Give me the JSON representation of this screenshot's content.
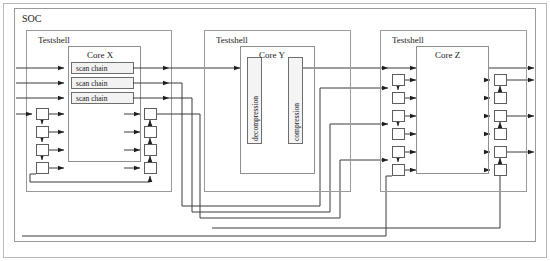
{
  "diagram": {
    "title": "SOC",
    "type": "block-diagram",
    "frame": {
      "x": 6,
      "y": 6,
      "w": 538,
      "h": 249
    },
    "soc": {
      "label": "SOC",
      "label_x": 22,
      "label_y": 12,
      "box": {
        "x": 14,
        "y": 8,
        "w": 522,
        "h": 234
      }
    },
    "testshells": [
      {
        "id": "testshell-x",
        "label": "Testshell",
        "label_x": 38,
        "label_y": 34,
        "box": {
          "x": 26,
          "y": 30,
          "w": 145,
          "h": 162
        },
        "core": {
          "id": "core-x",
          "label": "Core X",
          "label_x": 102,
          "label_y": 50,
          "box": {
            "x": 68,
            "y": 46,
            "w": 72,
            "h": 116
          },
          "scan_chains": [
            {
              "label": "scan chain",
              "x": 71,
              "y": 62,
              "w": 62,
              "h": 11
            },
            {
              "label": "scan chain",
              "x": 71,
              "y": 77,
              "w": 62,
              "h": 11
            },
            {
              "label": "scan chain",
              "x": 71,
              "y": 92,
              "w": 62,
              "h": 11
            }
          ]
        },
        "input_cells": [
          {
            "x": 36,
            "y": 108,
            "w": 12,
            "h": 12
          },
          {
            "x": 36,
            "y": 126,
            "w": 12,
            "h": 12
          },
          {
            "x": 36,
            "y": 144,
            "w": 12,
            "h": 12
          },
          {
            "x": 36,
            "y": 162,
            "w": 12,
            "h": 12
          }
        ],
        "output_cells": [
          {
            "x": 144,
            "y": 108,
            "w": 12,
            "h": 12
          },
          {
            "x": 144,
            "y": 126,
            "w": 12,
            "h": 12
          },
          {
            "x": 144,
            "y": 144,
            "w": 12,
            "h": 12
          },
          {
            "x": 144,
            "y": 162,
            "w": 12,
            "h": 12
          }
        ]
      },
      {
        "id": "testshell-y",
        "label": "Testshell",
        "label_x": 216,
        "label_y": 34,
        "box": {
          "x": 204,
          "y": 30,
          "w": 146,
          "h": 162
        },
        "core": {
          "id": "core-y",
          "label": "Core Y",
          "label_x": 262,
          "label_y": 50,
          "box": {
            "x": 240,
            "y": 46,
            "w": 74,
            "h": 128
          },
          "blocks": [
            {
              "id": "decompression",
              "label": "decompression",
              "x": 247,
              "y": 57,
              "w": 14,
              "h": 86
            },
            {
              "id": "compression",
              "label": "compression",
              "x": 288,
              "y": 57,
              "w": 14,
              "h": 86
            }
          ]
        }
      },
      {
        "id": "testshell-z",
        "label": "Testshell",
        "label_x": 392,
        "label_y": 34,
        "box": {
          "x": 380,
          "y": 30,
          "w": 146,
          "h": 162
        },
        "core": {
          "id": "core-z",
          "label": "Core Z",
          "label_x": 438,
          "label_y": 50,
          "box": {
            "x": 420,
            "y": 46,
            "w": 68,
            "h": 116
          },
          "scan_chains": []
        },
        "input_cells": [
          {
            "x": 392,
            "y": 74,
            "w": 12,
            "h": 12
          },
          {
            "x": 392,
            "y": 92,
            "w": 12,
            "h": 12
          },
          {
            "x": 392,
            "y": 110,
            "w": 12,
            "h": 12
          },
          {
            "x": 392,
            "y": 128,
            "w": 12,
            "h": 12
          },
          {
            "x": 392,
            "y": 146,
            "w": 12,
            "h": 12
          },
          {
            "x": 392,
            "y": 164,
            "w": 12,
            "h": 12
          }
        ],
        "output_cells": [
          {
            "x": 494,
            "y": 74,
            "w": 12,
            "h": 12
          },
          {
            "x": 494,
            "y": 92,
            "w": 12,
            "h": 12
          },
          {
            "x": 494,
            "y": 110,
            "w": 12,
            "h": 12
          },
          {
            "x": 494,
            "y": 128,
            "w": 12,
            "h": 12
          },
          {
            "x": 494,
            "y": 146,
            "w": 12,
            "h": 12
          },
          {
            "x": 494,
            "y": 164,
            "w": 12,
            "h": 12
          }
        ]
      }
    ],
    "colors": {
      "line": "#3a3a3a",
      "box_border": "#8a8a8a",
      "cell_border": "#6e6e6e",
      "cell_fill": "#ffffff",
      "scan_fill": "#f2f2f2",
      "text": "#1a1a1a",
      "background": "#ffffff"
    }
  }
}
